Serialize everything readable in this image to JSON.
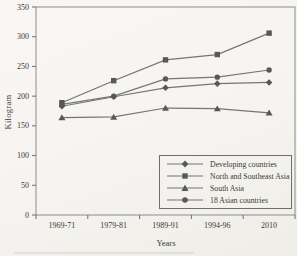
{
  "figure": {
    "background": "#f6f5f1",
    "frame_color": "#8c8c8c",
    "axis_color": "#6f6f6f",
    "line_color": "#757575",
    "marker_color": "#585858",
    "text_color": "#3b3933",
    "legend_border_color": "#6e6e6e"
  },
  "chart_data": {
    "type": "line",
    "title": "",
    "xlabel": "Years",
    "ylabel": "Kilogram",
    "categories": [
      "1969-71",
      "1979-81",
      "1989-91",
      "1994-96",
      "2010"
    ],
    "yticks": [
      0,
      50,
      100,
      150,
      200,
      250,
      300,
      350
    ],
    "ylim": [
      0,
      350
    ],
    "grid": false,
    "legend_position": "lower right",
    "series": [
      {
        "name": "Developing countries",
        "marker": "diamond",
        "values": [
          183,
          199,
          214,
          221,
          223
        ]
      },
      {
        "name": "North and Southeast Asia",
        "marker": "square",
        "values": [
          189,
          226,
          261,
          270,
          306
        ]
      },
      {
        "name": "South Asia",
        "marker": "triangle",
        "values": [
          164,
          165,
          180,
          179,
          172
        ]
      },
      {
        "name": "18 Asian countries",
        "marker": "circle",
        "values": [
          186,
          200,
          229,
          232,
          244
        ]
      }
    ]
  }
}
